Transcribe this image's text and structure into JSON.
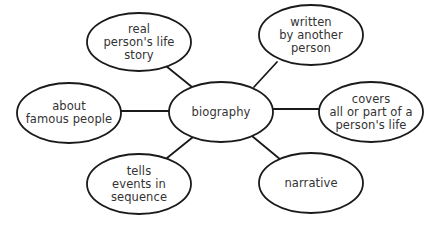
{
  "diagram": {
    "type": "concept-web",
    "colors": {
      "line": "#1a1a1a",
      "fill": "#ffffff",
      "text": "#333333"
    },
    "center": {
      "id": "biography",
      "label": "biography",
      "cx": 221,
      "cy": 112,
      "rx": 52,
      "ry": 30
    },
    "nodes": [
      {
        "id": "real-life-story",
        "label": "real\nperson's life\nstory",
        "cx": 139,
        "cy": 42,
        "rx": 52,
        "ry": 29
      },
      {
        "id": "written-by-another",
        "label": "written\nby another\nperson",
        "cx": 311,
        "cy": 35,
        "rx": 52,
        "ry": 30
      },
      {
        "id": "about-famous-people",
        "label": "about\nfamous people",
        "cx": 69,
        "cy": 113,
        "rx": 52,
        "ry": 30
      },
      {
        "id": "covers-life",
        "label": "covers\nall or part of a\nperson's life",
        "cx": 371,
        "cy": 112,
        "rx": 52,
        "ry": 30
      },
      {
        "id": "tells-events",
        "label": "tells\nevents in\nsequence",
        "cx": 139,
        "cy": 184,
        "rx": 52,
        "ry": 30
      },
      {
        "id": "narrative",
        "label": "narrative",
        "cx": 311,
        "cy": 183,
        "rx": 52,
        "ry": 30
      }
    ],
    "edges": [
      {
        "from": "biography",
        "to": "real-life-story",
        "x1": 192,
        "y1": 87,
        "x2": 166,
        "y2": 66
      },
      {
        "from": "biography",
        "to": "written-by-another",
        "x1": 254,
        "y1": 87,
        "x2": 277,
        "y2": 62
      },
      {
        "from": "biography",
        "to": "about-famous-people",
        "x1": 169,
        "y1": 111,
        "x2": 121,
        "y2": 111
      },
      {
        "from": "biography",
        "to": "covers-life",
        "x1": 273,
        "y1": 109,
        "x2": 320,
        "y2": 109
      },
      {
        "from": "biography",
        "to": "tells-events",
        "x1": 193,
        "y1": 137,
        "x2": 167,
        "y2": 158
      },
      {
        "from": "biography",
        "to": "narrative",
        "x1": 252,
        "y1": 136,
        "x2": 281,
        "y2": 160
      }
    ]
  }
}
